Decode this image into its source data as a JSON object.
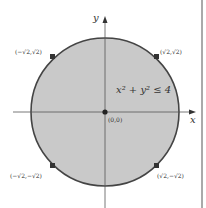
{
  "diagram": {
    "type": "disk-region",
    "axes": {
      "x_label": "x",
      "y_label": "y"
    },
    "inequality": "x² + y² ≤ 4",
    "origin_label": "(0,0)",
    "points": [
      {
        "label": "(−√2,√2)"
      },
      {
        "label": "(√2,√2)"
      },
      {
        "label": "(−√2,−√2)"
      },
      {
        "label": "(√2,−√2)"
      }
    ],
    "colors": {
      "fill": "#c8c8c8",
      "stroke": "#444444",
      "axis": "#555555",
      "point": "#333333"
    }
  }
}
